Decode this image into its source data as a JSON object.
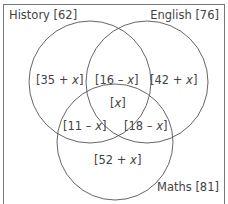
{
  "diagram": {
    "type": "venn-3-set",
    "sets": [
      {
        "name": "History",
        "total": "62",
        "label": "History [62]"
      },
      {
        "name": "English",
        "total": "76",
        "label": "English [76]"
      },
      {
        "name": "Maths",
        "total": "81",
        "label": "Maths [81]"
      }
    ],
    "regions": {
      "history_only": {
        "prefix": "[35 + ",
        "var": "x",
        "suffix": "]"
      },
      "english_only": {
        "prefix": "[42 + ",
        "var": "x",
        "suffix": "]"
      },
      "maths_only": {
        "prefix": "[52 + ",
        "var": "x",
        "suffix": "]"
      },
      "history_english": {
        "prefix": "[16 – ",
        "var": "x",
        "suffix": "]"
      },
      "history_maths": {
        "prefix": "[11 – ",
        "var": "x",
        "suffix": "]"
      },
      "english_maths": {
        "prefix": "[18 – ",
        "var": "x",
        "suffix": "]"
      },
      "all_three": {
        "prefix": "[",
        "var": "x",
        "suffix": "]"
      }
    },
    "colors": {
      "stroke": "#555555",
      "frame": "#777777",
      "text": "#444444",
      "background": "#ffffff"
    }
  }
}
